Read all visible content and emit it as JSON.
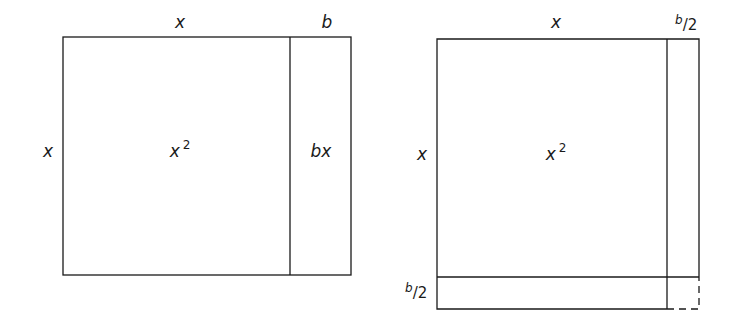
{
  "diagrams": [
    {
      "name": "square-plus-rectangle",
      "top_labels": [
        "x",
        "b"
      ],
      "left_label": "x",
      "regions": [
        {
          "label": "x",
          "label_sup": "2"
        },
        {
          "label": "bx"
        }
      ]
    },
    {
      "name": "completing-the-square",
      "top_labels": {
        "main": "x",
        "half_num": "b",
        "half_slash": "/",
        "half_den": "2"
      },
      "left_label": "x",
      "bottom_left_label": {
        "num": "b",
        "slash": "/",
        "den": "2"
      },
      "regions": [
        {
          "label": "x",
          "label_sup": "2"
        }
      ],
      "missing_corner": "dashed"
    }
  ],
  "colors": {
    "line": "#1a1a1a",
    "background": "#ffffff"
  }
}
